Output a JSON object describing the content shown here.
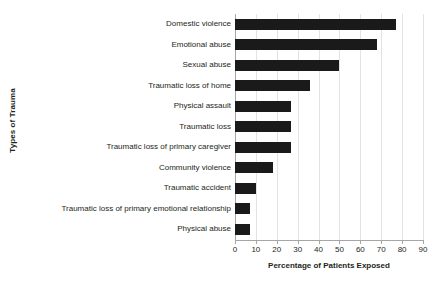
{
  "chart_data": {
    "type": "bar",
    "orientation": "horizontal",
    "title": "",
    "xlabel": "Percentage of Patients Exposed",
    "ylabel": "Types of Trauma",
    "xlim": [
      0,
      90
    ],
    "xticks": [
      0,
      10,
      20,
      30,
      40,
      50,
      60,
      70,
      80,
      90
    ],
    "grid": true,
    "legend": null,
    "bar_color": "#1a1a1a",
    "background_color": "#ffffff",
    "axis_color": "#a6a6a6",
    "gridline_color": "#e3e3e3",
    "categories": [
      "Domestic violence",
      "Emotional abuse",
      "Sexual abuse",
      "Traumatic loss of home",
      "Physical assault",
      "Traumatic loss",
      "Traumatic loss of primary caregiver",
      "Community violence",
      "Traumatic accident",
      "Traumatic loss of primary emotional relationship",
      "Physical abuse"
    ],
    "values": [
      77,
      68,
      50,
      36,
      27,
      27,
      27,
      18,
      10,
      7,
      7
    ]
  }
}
